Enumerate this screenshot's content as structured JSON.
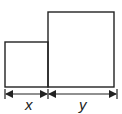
{
  "diagram": {
    "shapes": [
      {
        "id": "small-rectangle",
        "x": 5,
        "y": 42,
        "width": 43,
        "height": 45
      },
      {
        "id": "tall-rectangle",
        "x": 48,
        "y": 12,
        "width": 66,
        "height": 75
      }
    ],
    "dimensions": [
      {
        "label": "x",
        "from": 5,
        "to": 48
      },
      {
        "label": "y",
        "from": 48,
        "to": 117
      }
    ],
    "colors": {
      "stroke": "#222222",
      "background": "#ffffff"
    }
  }
}
